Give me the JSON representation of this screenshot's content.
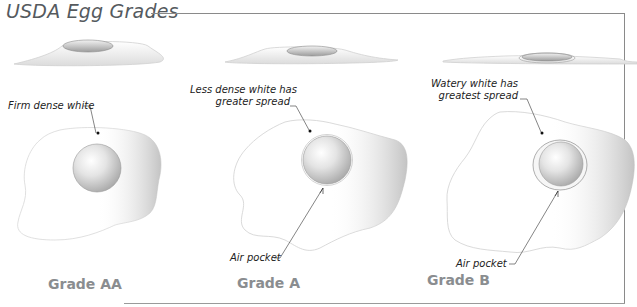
{
  "title": "USDA Egg Grades",
  "colors": {
    "title": "#555a5e",
    "grade_label": "#8a8d90",
    "frame": "#8a8a8a",
    "egg_white_outline": "#cfcfcf",
    "yolk": "#d9d9d9",
    "annotation_text": "#222222"
  },
  "grades": [
    {
      "name": "Grade AA",
      "annotations": [
        {
          "text": "Firm dense white"
        }
      ]
    },
    {
      "name": "Grade A",
      "annotations": [
        {
          "text_line1": "Less dense white has",
          "text_line2": "greater spread"
        },
        {
          "text": "Air pocket"
        }
      ]
    },
    {
      "name": "Grade B",
      "annotations": [
        {
          "text_line1": "Watery white has",
          "text_line2": "greatest spread"
        },
        {
          "text": "Air pocket"
        }
      ]
    }
  ]
}
